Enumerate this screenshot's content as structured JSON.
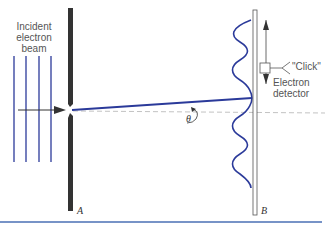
{
  "labels": {
    "incident": [
      "Incident",
      "electron",
      "beam"
    ],
    "click": "\"Click\"",
    "detector": [
      "Electron",
      "detector"
    ],
    "theta": "θ",
    "screen_a": "A",
    "screen_b": "B"
  },
  "colors": {
    "beam": "#2b3a9a",
    "screen": "#333333",
    "rule": "#4a6fb5"
  }
}
